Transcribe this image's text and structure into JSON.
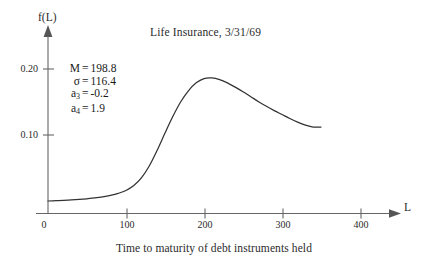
{
  "chart_data": {
    "type": "line",
    "title": "Life Insurance, 3/31/69",
    "xlabel": "L",
    "ylabel": "f(L)",
    "caption": "Time to maturity of debt instruments held",
    "xlim": [
      0,
      430
    ],
    "ylim": [
      0,
      0.215
    ],
    "grid": false,
    "legend": "none",
    "axis_arrows": true,
    "xticks": [
      0,
      100,
      200,
      300,
      400
    ],
    "xtick_labels": [
      "0",
      "100",
      "200",
      "300",
      "400"
    ],
    "yticks": [
      0.1,
      0.2
    ],
    "ytick_labels": [
      "0.10",
      "0.20"
    ],
    "series": [
      {
        "name": "f(L)",
        "x": [
          0,
          10,
          20,
          30,
          40,
          50,
          60,
          70,
          80,
          90,
          100,
          110,
          120,
          130,
          140,
          150,
          160,
          170,
          180,
          190,
          200,
          210,
          220,
          230,
          240,
          250,
          260,
          270,
          280,
          290,
          300,
          310,
          320,
          330,
          340,
          350
        ],
        "y": [
          0.0,
          0.0005,
          0.001,
          0.0016,
          0.0024,
          0.0034,
          0.0046,
          0.0062,
          0.0084,
          0.0115,
          0.016,
          0.0235,
          0.0355,
          0.0535,
          0.077,
          0.103,
          0.128,
          0.15,
          0.167,
          0.179,
          0.1855,
          0.1865,
          0.184,
          0.179,
          0.1725,
          0.1655,
          0.158,
          0.1505,
          0.1435,
          0.137,
          0.131,
          0.125,
          0.1195,
          0.115,
          0.112,
          0.112
        ]
      }
    ],
    "annotations": {
      "stats": [
        {
          "symbol": "M",
          "sub": "",
          "value": "198.8"
        },
        {
          "symbol": "σ",
          "sub": "",
          "value": "116.4"
        },
        {
          "symbol": "a",
          "sub": "3",
          "value": "-0.2"
        },
        {
          "symbol": "a",
          "sub": "4",
          "value": "1.9"
        }
      ]
    },
    "colors": {
      "background": "#ffffff",
      "curve": "#333333",
      "axis": "#555555",
      "text": "#2b2b2b"
    }
  }
}
